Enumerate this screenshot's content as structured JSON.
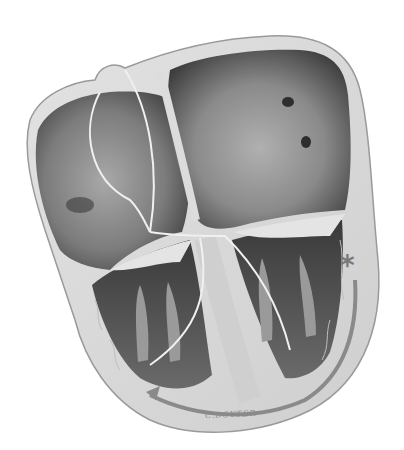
{
  "image": {
    "subject": "Heart cross-section illustration showing cardiac conduction system",
    "style": "grayscale",
    "colors": {
      "background": "#ffffff",
      "wall": "#d6d6d6",
      "wall_outline": "#9a9a9a",
      "chamber_dark": "#4a4a4a",
      "chamber_mid": "#8c8c8c",
      "chamber_light": "#c4c4c4",
      "conduction_path": "#8a8a8a",
      "trabeculae": "#b8b8b8"
    }
  },
  "annotations": {
    "marker_symbol": "*",
    "signature": "C.BOYTER"
  }
}
